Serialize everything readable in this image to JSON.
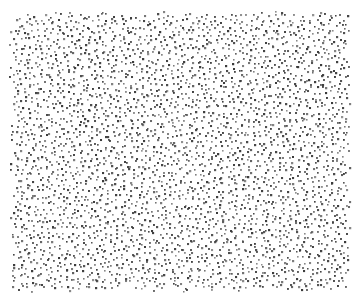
{
  "image": {
    "kind": "stipple-dot-texture",
    "width": 364,
    "height": 301,
    "background": "#ffffff",
    "field": {
      "x0": 8,
      "y0": 10,
      "x1": 352,
      "y1": 292
    },
    "dot": {
      "color": "#3a3a3a",
      "size": 1.9,
      "spacing": 5.6,
      "jitter": 0.42
    },
    "edge_fade": 6,
    "seed": 1337
  }
}
